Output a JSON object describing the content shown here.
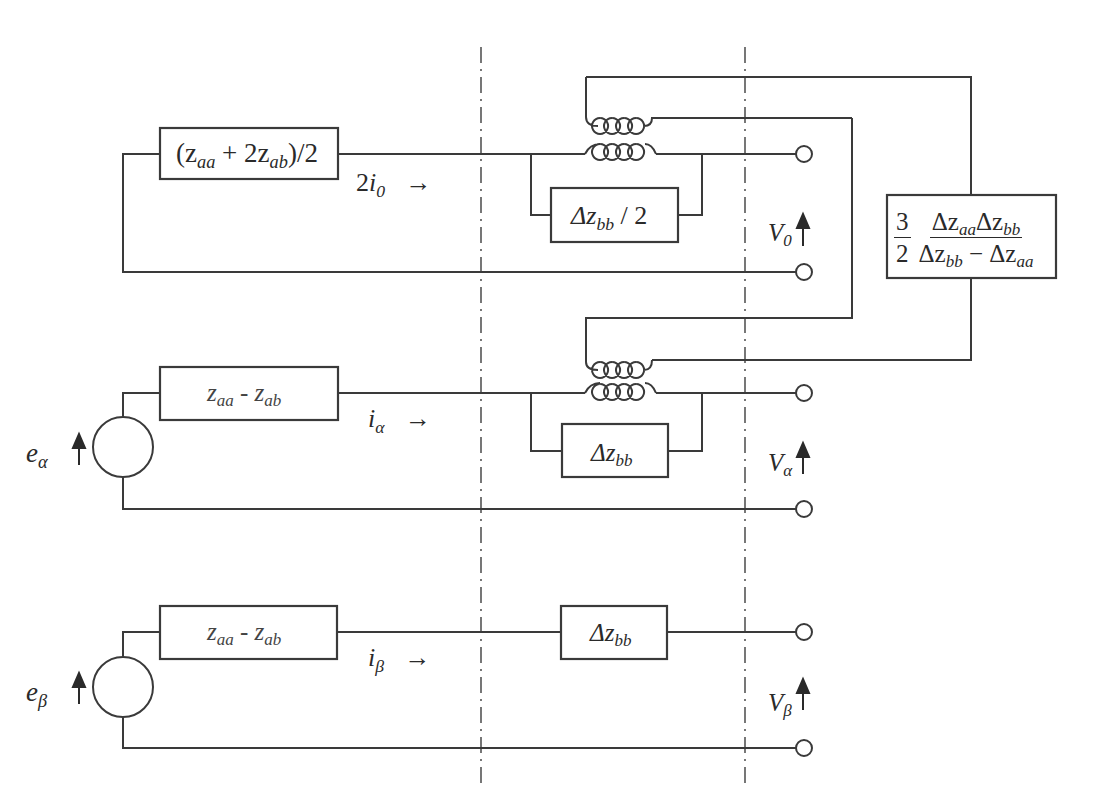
{
  "figure": {
    "type": "equivalent circuit in 0-alpha-beta components",
    "sections": {
      "zero": {
        "series_impedance": {
          "base": "(z",
          "sub1": "aa",
          "mid": " + 2z",
          "sub2": "ab",
          "tail": ")/2"
        },
        "current": {
          "coef": "2",
          "sym": "i",
          "sub": "0"
        },
        "shunt_impedance": {
          "delta": "Δz",
          "sub": "bb",
          "tail": " / 2"
        },
        "voltage": {
          "sym": "V",
          "sub": "0"
        }
      },
      "alpha": {
        "source": {
          "sym": "e",
          "sub": "α"
        },
        "series_impedance": {
          "a": "z",
          "sub1": "aa",
          "mid": " - z",
          "sub2": "ab"
        },
        "current": {
          "sym": "i",
          "sub": "α"
        },
        "shunt_impedance": {
          "delta": "Δz",
          "sub": "bb"
        },
        "voltage": {
          "sym": "V",
          "sub": "α"
        }
      },
      "beta": {
        "source": {
          "sym": "e",
          "sub": "β"
        },
        "series_impedance": {
          "a": "z",
          "sub1": "aa",
          "mid": " - z",
          "sub2": "ab"
        },
        "current": {
          "sym": "i",
          "sub": "β"
        },
        "series_extra_impedance": {
          "delta": "Δz",
          "sub": "bb"
        },
        "voltage": {
          "sym": "V",
          "sub": "β"
        }
      }
    },
    "coupling_impedance": {
      "coef_num": "3",
      "coef_den": "2",
      "num_a": "Δz",
      "num_a_sub": "aa",
      "num_b": "Δz",
      "num_b_sub": "bb",
      "den_a": "Δz",
      "den_a_sub": "bb",
      "den_op": " − ",
      "den_b": "Δz",
      "den_b_sub": "aa"
    },
    "colors": {
      "line": "#3a3a3a",
      "text": "#2a2a2a",
      "background": "#ffffff"
    }
  }
}
